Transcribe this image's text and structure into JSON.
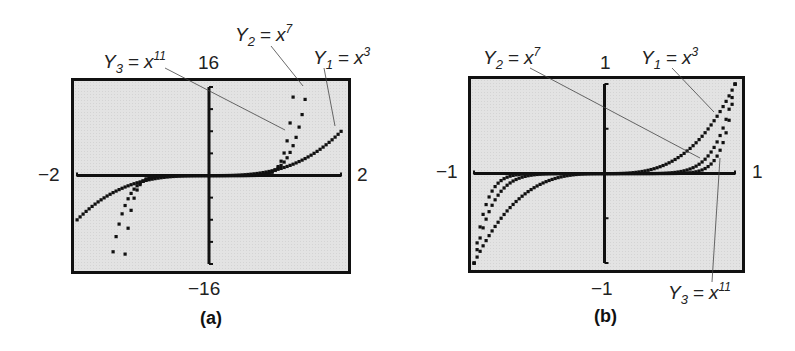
{
  "chart_data": [
    {
      "type": "line",
      "panel": "(a)",
      "title": "",
      "caption": "(a)",
      "xlabel": "",
      "ylabel": "",
      "xlim": [
        -2,
        2
      ],
      "ylim": [
        -16,
        16
      ],
      "x_tick_labels": {
        "min": "−2",
        "max": "2"
      },
      "y_tick_labels": {
        "min": "−16",
        "max": "16"
      },
      "grid": false,
      "series": [
        {
          "name": "Y1 = x^3",
          "label_var": "Y",
          "label_sub": "1",
          "label_base": "x",
          "label_exp": "3",
          "x": [
            -2,
            -1.5,
            -1,
            -0.5,
            0,
            0.5,
            1,
            1.5,
            2
          ],
          "values": [
            -8,
            -3.375,
            -1,
            -0.125,
            0,
            0.125,
            1,
            3.375,
            8
          ]
        },
        {
          "name": "Y2 = x^7",
          "label_var": "Y",
          "label_sub": "2",
          "label_base": "x",
          "label_exp": "7",
          "x": [
            -1.486,
            -1.3,
            -1.1,
            -1,
            0,
            1,
            1.1,
            1.3,
            1.486
          ],
          "values": [
            -16,
            -6.27,
            -1.95,
            -1,
            0,
            1,
            1.95,
            6.27,
            16
          ]
        },
        {
          "name": "Y3 = x^11",
          "label_var": "Y",
          "label_sub": "3",
          "label_base": "x",
          "label_exp": "11",
          "x": [
            -1.287,
            -1.2,
            -1.1,
            -1,
            0,
            1,
            1.1,
            1.2,
            1.287
          ],
          "values": [
            -16,
            -7.43,
            -2.85,
            -1,
            0,
            1,
            2.85,
            7.43,
            16
          ]
        }
      ]
    },
    {
      "type": "line",
      "panel": "(b)",
      "title": "",
      "caption": "(b)",
      "xlabel": "",
      "ylabel": "",
      "xlim": [
        -1,
        1
      ],
      "ylim": [
        -1,
        1
      ],
      "x_tick_labels": {
        "min": "−1",
        "max": "1"
      },
      "y_tick_labels": {
        "min": "−1",
        "max": "1"
      },
      "grid": false,
      "series": [
        {
          "name": "Y1 = x^3",
          "label_var": "Y",
          "label_sub": "1",
          "label_base": "x",
          "label_exp": "3",
          "x": [
            -1,
            -0.75,
            -0.5,
            -0.25,
            0,
            0.25,
            0.5,
            0.75,
            1
          ],
          "values": [
            -1,
            -0.42,
            -0.125,
            -0.016,
            0,
            0.016,
            0.125,
            0.42,
            1
          ]
        },
        {
          "name": "Y2 = x^7",
          "label_var": "Y",
          "label_sub": "2",
          "label_base": "x",
          "label_exp": "7",
          "x": [
            -1,
            -0.75,
            -0.5,
            -0.25,
            0,
            0.25,
            0.5,
            0.75,
            1
          ],
          "values": [
            -1,
            -0.133,
            -0.008,
            0,
            0,
            0,
            0.008,
            0.133,
            1
          ]
        },
        {
          "name": "Y3 = x^11",
          "label_var": "Y",
          "label_sub": "3",
          "label_base": "x",
          "label_exp": "11",
          "x": [
            -1,
            -0.75,
            -0.5,
            -0.25,
            0,
            0.25,
            0.5,
            0.75,
            1
          ],
          "values": [
            -1,
            -0.042,
            0,
            0,
            0,
            0,
            0,
            0.042,
            1
          ]
        }
      ]
    }
  ],
  "panels": {
    "a": {
      "caption": "(a)",
      "xmin": "−2",
      "xmax": "2",
      "ymin": "−16",
      "ymax": "16",
      "labels": {
        "y1": {
          "var": "Y",
          "sub": "1",
          "eq": "=",
          "base": "x",
          "exp": "3"
        },
        "y2": {
          "var": "Y",
          "sub": "2",
          "eq": "=",
          "base": "x",
          "exp": "7"
        },
        "y3": {
          "var": "Y",
          "sub": "3",
          "eq": "=",
          "base": "x",
          "exp": "11"
        }
      }
    },
    "b": {
      "caption": "(b)",
      "xmin": "−1",
      "xmax": "1",
      "ymin": "−1",
      "ymax": "1",
      "labels": {
        "y1": {
          "var": "Y",
          "sub": "1",
          "eq": "=",
          "base": "x",
          "exp": "3"
        },
        "y2": {
          "var": "Y",
          "sub": "2",
          "eq": "=",
          "base": "x",
          "exp": "7"
        },
        "y3": {
          "var": "Y",
          "sub": "3",
          "eq": "=",
          "base": "x",
          "exp": "11"
        }
      }
    }
  },
  "colors": {
    "screen_bg": "#e3e3e3",
    "curve": "#111111",
    "frame": "#111111",
    "leader": "#444444"
  }
}
